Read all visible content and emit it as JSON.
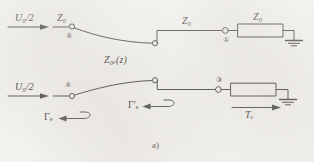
{
  "figure": {
    "caption": "a)",
    "background_color": "#f4f2ee",
    "ink_color": "#3a3835"
  },
  "labels": {
    "source_top": "U₀/2",
    "source_bottom": "U₀/2",
    "line_impedance_top_left": "Z₀",
    "line_impedance_top_right": "Z₀",
    "load_impedance_top": "Z₀",
    "taper_impedance": "Z₀ₑ(z)",
    "reflection_in": "Γₑ",
    "reflection_in_prime": "Γ'ₑ",
    "transmission": "Tₑ"
  },
  "nodes": [
    {
      "id": "node-2",
      "number": "②"
    },
    {
      "id": "node-1",
      "number": "①"
    },
    {
      "id": "node-4",
      "number": "④"
    },
    {
      "id": "node-3",
      "number": "③"
    }
  ],
  "elements": {
    "top_resistor_label": "Z₀",
    "ground_top": "ground-symbol",
    "ground_bottom": "ground-symbol",
    "arrow_source_top": "arrow-right",
    "arrow_source_bottom": "arrow-right",
    "arrow_reflection": "arrow-hook-left",
    "arrow_reflection_prime": "arrow-hook-left",
    "arrow_transmission": "arrow-right"
  }
}
